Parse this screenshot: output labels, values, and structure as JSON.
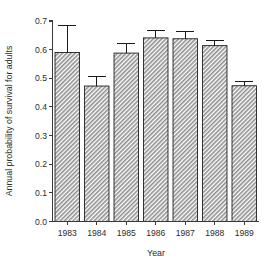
{
  "chart_data": {
    "type": "bar",
    "title": "",
    "xlabel": "Year",
    "ylabel": "Annual probability of survival for adults",
    "categories": [
      "1983",
      "1984",
      "1985",
      "1986",
      "1987",
      "1988",
      "1989"
    ],
    "values": [
      0.59,
      0.473,
      0.588,
      0.641,
      0.638,
      0.614,
      0.474
    ],
    "error_upper": [
      0.685,
      0.505,
      0.623,
      0.668,
      0.663,
      0.632,
      0.49
    ],
    "error_lower": [
      0.495,
      0.441,
      0.553,
      0.614,
      0.613,
      0.596,
      0.458
    ],
    "series": [
      {
        "name": "Annual probability of survival for adults",
        "values": [
          0.59,
          0.473,
          0.588,
          0.641,
          0.638,
          0.614,
          0.474
        ]
      }
    ],
    "ylim": [
      0.0,
      0.7
    ],
    "yticks": [
      0.0,
      0.1,
      0.2,
      0.3,
      0.4,
      0.5,
      0.6,
      0.7
    ],
    "ytick_labels": [
      "0.0",
      "0.1",
      "0.2",
      "0.3",
      "0.4",
      "0.5",
      "0.6",
      "0.7"
    ],
    "grid": false,
    "legend": "none",
    "error_bars": "upper-only-visible",
    "bar_fill_pattern": "diagonal-hatch",
    "bar_fill_color": "#9a9a9a",
    "bar_edge_color": "#202020",
    "axis_color": "#3a3a3a"
  },
  "axes": {
    "y_title": "Annual probability of survival for adults",
    "x_title": "Year"
  }
}
